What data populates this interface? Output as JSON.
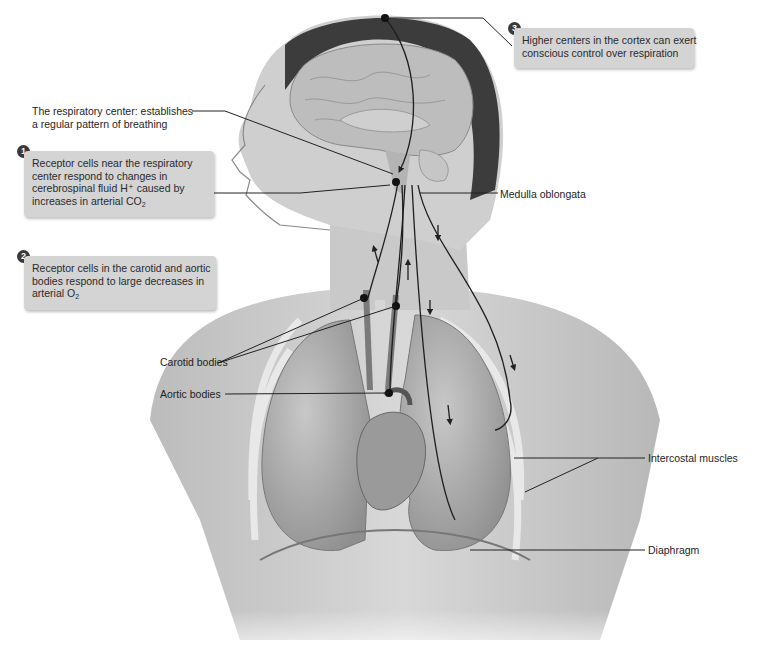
{
  "figure": {
    "style": "grayscale anatomical illustration"
  },
  "callouts": [
    {
      "number": "1",
      "lines": [
        "Receptor cells near the respiratory",
        "center respond to changes in",
        "cerebrospinal fluid H⁺ caused by",
        "increases in arterial CO"
      ],
      "subscript": "2"
    },
    {
      "number": "2",
      "lines": [
        "Receptor cells in the carotid and aortic",
        "bodies respond to large decreases in",
        "arterial O"
      ],
      "subscript": "2"
    },
    {
      "number": "3",
      "lines": [
        "Higher centers in the cortex can exert",
        "conscious control over respiration"
      ]
    }
  ],
  "labels": {
    "respiratory_center_line1": "The respiratory center: establishes",
    "respiratory_center_line2": "a regular pattern of breathing",
    "medulla": "Medulla oblongata",
    "carotid": "Carotid bodies",
    "aortic": "Aortic bodies",
    "intercostal": "Intercostal muscles",
    "diaphragm": "Diaphragm"
  },
  "colors": {
    "callout_bg": "#d4d4d4",
    "badge": "#3a3a3a",
    "leader_line": "#222222",
    "skin": "#cfcfcf",
    "hair": "#3c3c3c",
    "brain": "#bdbdbd",
    "lung": "#b0b0b0"
  }
}
